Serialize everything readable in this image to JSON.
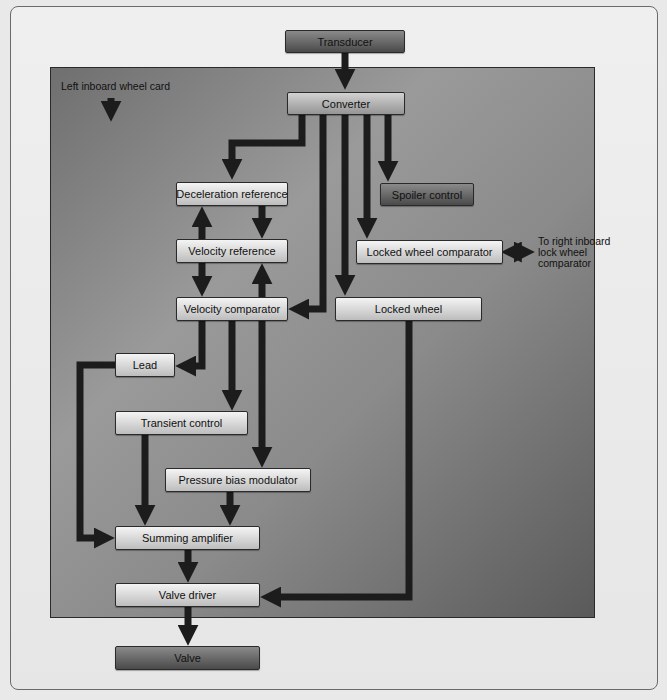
{
  "diagram": {
    "panel_label": "Left inboard wheel card",
    "side_note_lines": [
      "To right inboard",
      "lock wheel",
      "comparator"
    ],
    "nodes": {
      "transducer": "Transducer",
      "converter": "Converter",
      "deceleration_reference": "Deceleration reference",
      "spoiler_control": "Spoiler control",
      "velocity_reference": "Velocity reference",
      "locked_wheel_comparator": "Locked wheel comparator",
      "velocity_comparator": "Velocity comparator",
      "locked_wheel": "Locked wheel",
      "lead": "Lead",
      "transient_control": "Transient control",
      "pressure_bias_modulator": "Pressure bias modulator",
      "summing_amplifier": "Summing amplifier",
      "valve_driver": "Valve driver",
      "valve": "Valve"
    },
    "edges": [
      {
        "from": "Transducer",
        "to": "Converter"
      },
      {
        "from": "Converter",
        "to": "Deceleration reference"
      },
      {
        "from": "Converter",
        "to": "Velocity comparator"
      },
      {
        "from": "Converter",
        "to": "Locked wheel"
      },
      {
        "from": "Converter",
        "to": "Locked wheel comparator"
      },
      {
        "from": "Converter",
        "to": "Spoiler control"
      },
      {
        "from": "Deceleration reference",
        "to": "Velocity reference"
      },
      {
        "from": "Velocity reference",
        "to": "Deceleration reference"
      },
      {
        "from": "Velocity reference",
        "to": "Velocity comparator"
      },
      {
        "from": "Velocity comparator",
        "to": "Velocity reference"
      },
      {
        "from": "Velocity comparator",
        "to": "Lead"
      },
      {
        "from": "Velocity comparator",
        "to": "Transient control"
      },
      {
        "from": "Velocity comparator",
        "to": "Pressure bias modulator"
      },
      {
        "from": "Lead",
        "to": "Summing amplifier"
      },
      {
        "from": "Transient control",
        "to": "Summing amplifier"
      },
      {
        "from": "Pressure bias modulator",
        "to": "Summing amplifier"
      },
      {
        "from": "Summing amplifier",
        "to": "Valve driver"
      },
      {
        "from": "Locked wheel",
        "to": "Valve driver"
      },
      {
        "from": "Valve driver",
        "to": "Valve"
      },
      {
        "from": "Locked wheel comparator",
        "to": "To right inboard lock wheel comparator",
        "bidirectional": true
      }
    ],
    "colors": {
      "panel": "#8a8a8a",
      "box_light": "#d6d6d6",
      "box_dark": "#6a6a6a",
      "arrow": "#1c1c1c"
    }
  }
}
